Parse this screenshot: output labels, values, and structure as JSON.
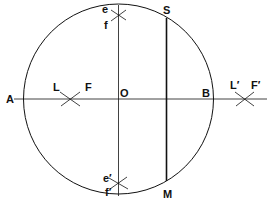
{
  "diagram": {
    "labels": {
      "A": "A",
      "B": "B",
      "O": "O",
      "S": "S",
      "M": "M",
      "L": "L",
      "F": "F",
      "L2": "L′",
      "F2": "F′",
      "e": "e",
      "f": "f",
      "e2": "e′",
      "f2": "f′"
    },
    "colors": {
      "stroke": "#111111",
      "background": "#ffffff"
    }
  }
}
